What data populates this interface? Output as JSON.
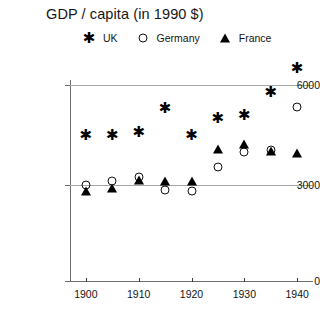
{
  "chart_data": {
    "type": "scatter",
    "title": "GDP / capita (in 1990 $)",
    "xlabel": "",
    "ylabel": "",
    "x": [
      1900,
      1905,
      1910,
      1915,
      1920,
      1925,
      1930,
      1935,
      1940
    ],
    "xlim": [
      1897,
      1943
    ],
    "ylim": [
      0,
      7000
    ],
    "yticks": [
      0,
      3000,
      6000
    ],
    "ytick_labels": [
      "0",
      "3000",
      "6000"
    ],
    "xticks": [
      1900,
      1910,
      1920,
      1930,
      1940
    ],
    "xtick_labels": [
      "1900",
      "1910",
      "1920",
      "1930",
      "1940"
    ],
    "grid": "horizontal-at-3000-and-6000",
    "legend_position": "top-center",
    "series": [
      {
        "name": "UK",
        "marker": "asterisk",
        "color": "#000000",
        "values": [
          4500,
          4500,
          4600,
          5300,
          4500,
          5000,
          5100,
          5800,
          6500
        ]
      },
      {
        "name": "Germany",
        "marker": "circle-open",
        "color": "#111111",
        "values": [
          3000,
          3130,
          3250,
          2850,
          2800,
          3550,
          4000,
          4050,
          5350
        ]
      },
      {
        "name": "France",
        "marker": "triangle-filled",
        "color": "#000000",
        "values": [
          2880,
          2980,
          3220,
          3200,
          3200,
          4150,
          4300,
          4100,
          4050
        ]
      }
    ]
  },
  "legend": {
    "entries": [
      {
        "label": "UK",
        "marker": "asterisk-icon"
      },
      {
        "label": "Germany",
        "marker": "circle-open-icon"
      },
      {
        "label": "France",
        "marker": "triangle-filled-icon"
      }
    ]
  }
}
